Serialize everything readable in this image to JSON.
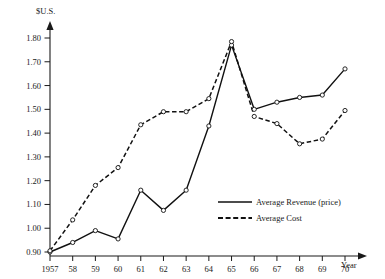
{
  "chart_data": {
    "type": "line",
    "title": "",
    "xlabel": "Year",
    "ylabel": "$U.S.",
    "x": [
      1957,
      1958,
      1959,
      1960,
      1961,
      1962,
      1963,
      1964,
      1965,
      1966,
      1967,
      1968,
      1969,
      1970
    ],
    "xtick_labels": [
      "1957",
      "58",
      "59",
      "60",
      "61",
      "62",
      "63",
      "64",
      "65",
      "66",
      "67",
      "68",
      "69",
      "70"
    ],
    "ytick_labels": [
      "0.90",
      "1.00",
      "1.10",
      "1.20",
      "1.30",
      "1.40",
      "1.50",
      "1.60",
      "1.70",
      "1.80"
    ],
    "ytick_values": [
      0.9,
      1.0,
      1.1,
      1.2,
      1.3,
      1.4,
      1.5,
      1.6,
      1.7,
      1.8
    ],
    "ylim": [
      0.9,
      1.8
    ],
    "xlim": [
      1957,
      1970
    ],
    "grid": false,
    "legend_position": "lower right",
    "series": [
      {
        "name": "Average Revenue (price)",
        "style": "solid",
        "values": [
          0.9,
          0.94,
          0.99,
          0.955,
          1.16,
          1.075,
          1.16,
          1.43,
          1.77,
          1.5,
          1.53,
          1.55,
          1.56,
          1.67
        ]
      },
      {
        "name": "Average Cost",
        "style": "dashed",
        "values": [
          0.905,
          1.035,
          1.18,
          1.255,
          1.435,
          1.49,
          1.49,
          1.545,
          1.785,
          1.47,
          1.44,
          1.355,
          1.375,
          1.495
        ]
      }
    ]
  },
  "axes": {
    "y_axis_title": "$U.S.",
    "x_axis_title": "Year"
  },
  "legend": {
    "items": [
      {
        "label": "Average Revenue (price)",
        "style": "solid"
      },
      {
        "label": "Average Cost",
        "style": "dashed"
      }
    ]
  },
  "colors": {
    "line": "#111111",
    "text": "#1a1a1a",
    "background": "#ffffff"
  }
}
